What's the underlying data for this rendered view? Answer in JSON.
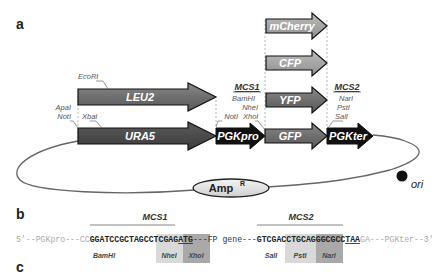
{
  "panels": {
    "a": "a",
    "b": "b",
    "c": "c"
  },
  "plasmid": {
    "genes": {
      "leu2": "LEU2",
      "ura5": "URA5",
      "pgkpro": "PGKpro",
      "gfp": "GFP",
      "yfp": "YFP",
      "cfp": "CFP",
      "mcherry": "mCherry",
      "pgkter": "PGKter"
    },
    "sites": {
      "ecori": "EcoRI",
      "apai": "ApaI",
      "noti_left": "NotI",
      "xbai": "XbaI",
      "noti_mid": "NotI",
      "bamhi": "BamHI",
      "nhei": "NheI",
      "xhoi": "XhoI",
      "nari": "NarI",
      "psti": "PstI",
      "sali": "SalI"
    },
    "mcs1": "MCS1",
    "mcs2": "MCS2",
    "amp": "Amp",
    "amp_sup": "R",
    "ori": "ori"
  },
  "sequence": {
    "mcs1": "MCS1",
    "mcs2": "MCS2",
    "left_prefix": "5'--PGKpro---CC",
    "mcs1_bamhi": "GGATCC",
    "mcs1_nhei": "GCTAGC",
    "mcs1_xhoi": "CTCGAG",
    "start_codon": "ATG",
    "middle": "---FP gene---",
    "mcs2_sali": "GTCGAC",
    "mcs2_psti": "CTGCAG",
    "mcs2_nari": "GGCGCC",
    "stop_codon": "TAA",
    "right_suffix": "GA---PGKter--3'",
    "enzymes": {
      "bamhi": "BamHI",
      "nhei": "NheI",
      "xhoi": "XhoI",
      "sali": "SalI",
      "psti": "PstI",
      "nari": "NarI"
    }
  }
}
